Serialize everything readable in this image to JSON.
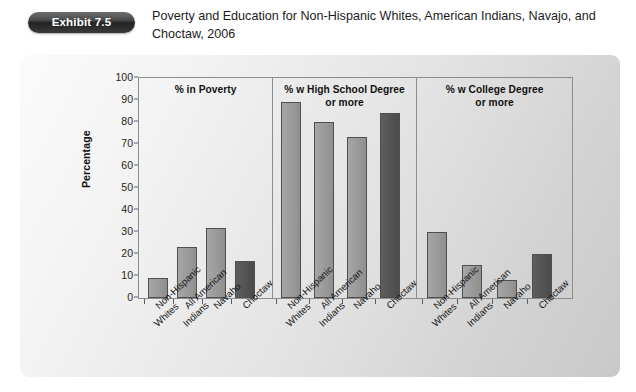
{
  "header": {
    "badge_label": "Exhibit 7.5",
    "title": "Poverty and Education for Non-Hispanic Whites, American Indians, Navajo, and Choctaw, 2006"
  },
  "chart_data": {
    "type": "bar",
    "title": "Poverty and Education for Non-Hispanic Whites, American Indians, Navajo, and Choctaw, 2006",
    "xlabel": "",
    "ylabel": "Percentage",
    "ylim": [
      0,
      100
    ],
    "ytick_labels": [
      "0",
      "10",
      "20",
      "30",
      "40",
      "50",
      "60",
      "70",
      "80",
      "90",
      "100"
    ],
    "ytick_values": [
      0,
      10,
      20,
      30,
      40,
      50,
      60,
      70,
      80,
      90,
      100
    ],
    "grid": false,
    "legend_position": "none",
    "categories": [
      {
        "line1": "Non-Hispanic",
        "line2": "Whites"
      },
      {
        "line1": "All American",
        "line2": "Indians"
      },
      {
        "line1": "Navaho",
        "line2": ""
      },
      {
        "line1": "Choctaw",
        "line2": ""
      }
    ],
    "panels": [
      {
        "header": "%  in Poverty",
        "values": [
          9,
          23,
          32,
          17
        ]
      },
      {
        "header": "% w High School Degree\nor more",
        "values": [
          89,
          80,
          73,
          84
        ]
      },
      {
        "header": "% w College Degree\nor more",
        "values": [
          30,
          15,
          8,
          20
        ]
      }
    ],
    "colors": {
      "bar_light": "#9a9a9a",
      "bar_dark": "#555555",
      "bar_outline": "#4f4f4f",
      "axis": "#8d8d8d",
      "card_background": "#e3e3e3",
      "text": "#161616",
      "badge_background": "#2b2b2b"
    },
    "highlight_category_index": 3
  }
}
